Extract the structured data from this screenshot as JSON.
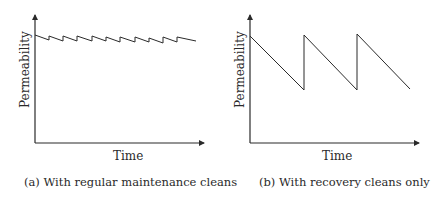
{
  "chart_data": [
    {
      "type": "line",
      "panel": "a",
      "title": "",
      "caption": "(a) With regular maintenance cleans",
      "xlabel": "Time",
      "ylabel": "Permeability",
      "grid": false,
      "ticks": false,
      "description": "Sawtooth with small amplitude: permeability declines slightly, regular maintenance cleans restore it often; overall slow downward drift",
      "points": [
        [
          35,
          35
        ],
        [
          49,
          40
        ],
        [
          49,
          36
        ],
        [
          63,
          41
        ],
        [
          63,
          36
        ],
        [
          77,
          41
        ],
        [
          77,
          36
        ],
        [
          92,
          41
        ],
        [
          92,
          36
        ],
        [
          106,
          41
        ],
        [
          106,
          37
        ],
        [
          120,
          42
        ],
        [
          120,
          37
        ],
        [
          135,
          42
        ],
        [
          135,
          37
        ],
        [
          149,
          42
        ],
        [
          149,
          38
        ],
        [
          163,
          43
        ],
        [
          163,
          37
        ],
        [
          177,
          42
        ],
        [
          177,
          37
        ],
        [
          196,
          41
        ]
      ]
    },
    {
      "type": "line",
      "panel": "b",
      "title": "",
      "caption": "(b) With recovery cleans only",
      "xlabel": "Time",
      "ylabel": "Permeability",
      "grid": false,
      "ticks": false,
      "description": "Sawtooth with large amplitude: permeability declines steeply, infrequent recovery cleans restore it",
      "points": [
        [
          250,
          36
        ],
        [
          304,
          90
        ],
        [
          304,
          35
        ],
        [
          357,
          90
        ],
        [
          357,
          34
        ],
        [
          410,
          89
        ]
      ]
    }
  ],
  "panels": {
    "a": {
      "ylabel": "Permeability",
      "xlabel": "Time",
      "caption": "(a) With regular maintenance cleans"
    },
    "b": {
      "ylabel": "Permeability",
      "xlabel": "Time",
      "caption": "(b) With recovery cleans only"
    }
  },
  "colors": {
    "line": "#2a2a2a",
    "background": "#ffffff"
  }
}
